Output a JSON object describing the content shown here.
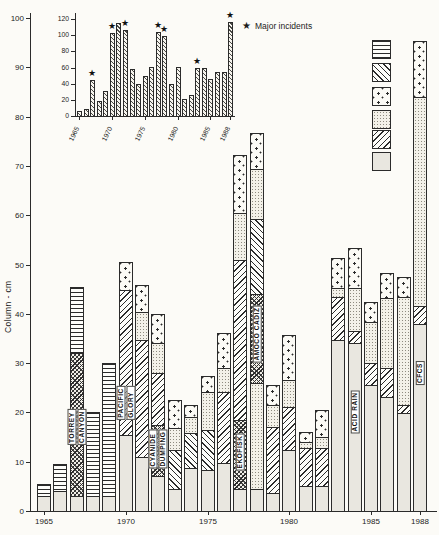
{
  "figure": {
    "axis_title_y": "Column - cm",
    "star_glyph": "★",
    "star_note": "Major incidents"
  },
  "legend": [
    {
      "label": "Undifferentiated",
      "pattern": "undifferentiated"
    },
    {
      "label": "Individual incidents",
      "pattern": "individual"
    },
    {
      "label": "Marine",
      "pattern": "marine"
    },
    {
      "label": "River and water",
      "pattern": "river_water"
    },
    {
      "label": "Industrial and oil",
      "pattern": "industrial_oil"
    },
    {
      "label": "Air",
      "pattern": "air"
    }
  ],
  "chart_data": [
    {
      "id": "main",
      "type": "bar",
      "subtype": "stacked",
      "ylabel": "Column - cm",
      "ylim": [
        0,
        100
      ],
      "yticks": [
        0,
        10,
        20,
        30,
        40,
        50,
        60,
        70,
        80,
        90,
        100
      ],
      "xtick_years": [
        1965,
        1970,
        1975,
        1980,
        1985,
        1988
      ],
      "categories": [
        "air",
        "industrial_oil",
        "individual",
        "individual_major",
        "river_water",
        "marine",
        "undifferentiated"
      ],
      "bars": [
        {
          "year": 1965,
          "segments": [
            [
              "air",
              0,
              3
            ],
            [
              "undifferentiated",
              3,
              5.5
            ]
          ]
        },
        {
          "year": 1966,
          "segments": [
            [
              "air",
              0,
              4
            ],
            [
              "undifferentiated",
              4,
              9.5
            ]
          ]
        },
        {
          "year": 1967,
          "label_lines": [
            "TORREY",
            "CANYON"
          ],
          "label_center": 17,
          "segments": [
            [
              "air",
              0,
              3
            ],
            [
              "individual_major",
              3,
              32
            ],
            [
              "undifferentiated",
              32,
              45.5
            ]
          ]
        },
        {
          "year": 1968,
          "segments": [
            [
              "air",
              0,
              3
            ],
            [
              "undifferentiated",
              3,
              20
            ]
          ]
        },
        {
          "year": 1969,
          "segments": [
            [
              "air",
              0,
              3
            ],
            [
              "undifferentiated",
              3,
              30
            ]
          ]
        },
        {
          "year": 1970,
          "label_lines": [
            "PACIFIC",
            "GLORY"
          ],
          "label_center": 22,
          "segments": [
            [
              "air",
              0,
              15.5
            ],
            [
              "industrial_oil",
              15.5,
              44.8
            ],
            [
              "marine",
              44.8,
              50.5
            ]
          ]
        },
        {
          "year": 1971,
          "segments": [
            [
              "air",
              0,
              11
            ],
            [
              "industrial_oil",
              11,
              34.7
            ],
            [
              "river_water",
              34.7,
              40.4
            ],
            [
              "marine",
              40.4,
              45.8
            ]
          ]
        },
        {
          "year": 1972,
          "label_lines": [
            "CYANIDE",
            "DUMPING"
          ],
          "label_center": 12.5,
          "segments": [
            [
              "air",
              0,
              7
            ],
            [
              "individual_major",
              7,
              17.5
            ],
            [
              "industrial_oil",
              17.5,
              28
            ],
            [
              "river_water",
              28,
              34
            ],
            [
              "marine",
              34,
              40
            ]
          ]
        },
        {
          "year": 1973,
          "segments": [
            [
              "air",
              0,
              4.5
            ],
            [
              "individual",
              4.5,
              12.4
            ],
            [
              "river_water",
              12.4,
              16.8
            ],
            [
              "marine",
              16.8,
              22.5
            ]
          ]
        },
        {
          "year": 1974,
          "segments": [
            [
              "air",
              0,
              8.7
            ],
            [
              "individual",
              8.7,
              15.8
            ],
            [
              "river_water",
              15.8,
              19
            ],
            [
              "marine",
              19,
              21.5
            ]
          ]
        },
        {
          "year": 1975,
          "segments": [
            [
              "air",
              0,
              8.3
            ],
            [
              "individual",
              8.3,
              16.4
            ],
            [
              "river_water",
              16.4,
              24.2
            ],
            [
              "marine",
              24.2,
              27.3
            ]
          ]
        },
        {
          "year": 1976,
          "segments": [
            [
              "air",
              0,
              9.7
            ],
            [
              "industrial_oil",
              9.7,
              24.2
            ],
            [
              "river_water",
              24.2,
              29
            ],
            [
              "marine",
              29,
              36.2
            ]
          ]
        },
        {
          "year": 1977,
          "label_lines": [
            "EKOFISK"
          ],
          "label_center": 12,
          "segments": [
            [
              "air",
              0,
              4.5
            ],
            [
              "individual_major",
              4.5,
              18.5
            ],
            [
              "industrial_oil",
              18.5,
              50.9
            ],
            [
              "river_water",
              50.9,
              60.4
            ],
            [
              "marine",
              60.4,
              72.2
            ]
          ]
        },
        {
          "year": 1978,
          "label_lines": [
            "AMOCO CADIZ"
          ],
          "label_center": 36,
          "segments": [
            [
              "air",
              0,
              4.5
            ],
            [
              "river_water",
              4.5,
              26
            ],
            [
              "individual_major",
              26,
              44
            ],
            [
              "individual",
              44,
              59.2
            ],
            [
              "river_water",
              59.2,
              69.4
            ],
            [
              "marine",
              69.4,
              76.7
            ]
          ]
        },
        {
          "year": 1979,
          "segments": [
            [
              "air",
              0,
              3.7
            ],
            [
              "industrial_oil",
              3.7,
              17
            ],
            [
              "river_water",
              17,
              21.5
            ],
            [
              "marine",
              21.5,
              25.6
            ]
          ]
        },
        {
          "year": 1980,
          "segments": [
            [
              "air",
              0,
              12.4
            ],
            [
              "industrial_oil",
              12.4,
              21
            ],
            [
              "river_water",
              21,
              26.6
            ],
            [
              "marine",
              26.6,
              35.7
            ]
          ]
        },
        {
          "year": 1981,
          "segments": [
            [
              "air",
              0,
              5
            ],
            [
              "industrial_oil",
              5,
              12.8
            ],
            [
              "river_water",
              12.8,
              14
            ],
            [
              "marine",
              14,
              16
            ]
          ]
        },
        {
          "year": 1982,
          "segments": [
            [
              "air",
              0,
              5
            ],
            [
              "industrial_oil",
              5,
              12.8
            ],
            [
              "river_water",
              12.8,
              15
            ],
            [
              "marine",
              15,
              20.5
            ]
          ]
        },
        {
          "year": 1983,
          "segments": [
            [
              "air",
              0,
              34.7
            ],
            [
              "industrial_oil",
              34.7,
              43.4
            ],
            [
              "river_water",
              43.4,
              45.2
            ],
            [
              "marine",
              45.2,
              51.3
            ]
          ]
        },
        {
          "year": 1984,
          "label_lines": [
            "ACID RAIN"
          ],
          "label_center": 20,
          "segments": [
            [
              "air",
              0,
              34.1
            ],
            [
              "industrial_oil",
              34.1,
              36.5
            ],
            [
              "river_water",
              36.5,
              45.2
            ],
            [
              "marine",
              45.2,
              53.3
            ]
          ]
        },
        {
          "year": 1985,
          "segments": [
            [
              "air",
              0,
              25.6
            ],
            [
              "industrial_oil",
              25.6,
              30
            ],
            [
              "river_water",
              30,
              38.3
            ],
            [
              "marine",
              38.3,
              42.4
            ]
          ]
        },
        {
          "year": 1986,
          "segments": [
            [
              "air",
              0,
              23.1
            ],
            [
              "industrial_oil",
              23.1,
              29
            ],
            [
              "river_water",
              29,
              43.2
            ],
            [
              "marine",
              43.2,
              48.3
            ]
          ]
        },
        {
          "year": 1987,
          "segments": [
            [
              "air",
              0,
              19.9
            ],
            [
              "industrial_oil",
              19.9,
              21.5
            ],
            [
              "river_water",
              21.5,
              43.4
            ],
            [
              "marine",
              43.4,
              47.5
            ]
          ]
        },
        {
          "year": 1988,
          "label_lines": [
            "CFCS"
          ],
          "label_center": 28,
          "segments": [
            [
              "air",
              0,
              38
            ],
            [
              "industrial_oil",
              38,
              41.5
            ],
            [
              "river_water",
              41.5,
              84
            ],
            [
              "marine",
              84,
              95.3
            ]
          ]
        }
      ]
    },
    {
      "id": "inset",
      "type": "bar",
      "ylim": [
        0,
        120
      ],
      "yticks": [
        0,
        20,
        40,
        60,
        80,
        100,
        120
      ],
      "xtick_years": [
        1965,
        1970,
        1975,
        1980,
        1985,
        1988
      ],
      "start_year": 1965,
      "values": [
        6,
        9,
        45,
        19,
        31,
        103,
        115,
        107,
        58,
        40,
        50,
        61,
        104,
        99,
        39,
        61,
        21,
        26,
        59,
        60,
        46,
        54,
        54,
        116
      ],
      "major_incident_years": [
        1967,
        1970,
        1972,
        1977,
        1978,
        1983,
        1988
      ],
      "legend_note": "Major incidents"
    }
  ]
}
